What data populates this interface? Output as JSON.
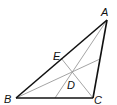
{
  "diagram": {
    "type": "triangle-with-cevians",
    "points": {
      "A": {
        "label": "A",
        "x": 107,
        "y": 20
      },
      "B": {
        "label": "B",
        "x": 16,
        "y": 98
      },
      "C": {
        "label": "C",
        "x": 93,
        "y": 98
      },
      "E": {
        "label": "E",
        "x": 61,
        "y": 58
      },
      "D": {
        "label": "D",
        "x": 72,
        "y": 72
      }
    },
    "labels": {
      "A": "A",
      "B": "B",
      "C": "C",
      "D": "D",
      "E": "E"
    },
    "colors": {
      "triangle": "#111111",
      "cevians": "#999999"
    }
  }
}
